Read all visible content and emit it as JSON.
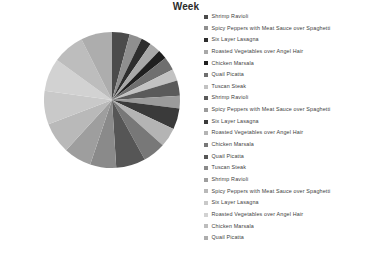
{
  "chart": {
    "title": "Week"
  },
  "chart_data": {
    "type": "pie",
    "title": "Week",
    "xlabel": "",
    "ylabel": "",
    "legend_position": "right",
    "grid": false,
    "center": [
      112,
      100
    ],
    "radius": 68,
    "start_angle_deg": -90,
    "direction": "clockwise",
    "categories": [
      "Shrimp Ravioli",
      "Spicy Peppers with Meat Sauce over Spaghetti",
      "Six Layer Lasagna",
      "Roasted Vegetables over Angel Hair",
      "Chicken Marsala",
      "Quail Picatta",
      "Tuscan Steak",
      "Shrimp Ravioli",
      "Spicy Peppers with Meat Sauce over Spaghetti",
      "Six Layer Lasagna",
      "Roasted Vegetables over Angel Hair",
      "Chicken Marsala",
      "Quail Picatta",
      "Tuscan Steak",
      "Shrimp Ravioli",
      "Spicy Peppers with Meat Sauce over Spaghetti",
      "Six Layer Lasagna",
      "Roasted Vegetables over Angel Hair",
      "Chicken Marsala",
      "Quail Picatta"
    ],
    "values": [
      4.2,
      3.0,
      2.4,
      2.6,
      2.2,
      3.2,
      2.8,
      3.6,
      3.0,
      5.0,
      4.6,
      5.4,
      7.0,
      6.2,
      6.6,
      7.4,
      8.0,
      7.8,
      7.6,
      7.4
    ],
    "colors": [
      "#4b4b4b",
      "#8f8f8f",
      "#2d2d2d",
      "#a8a8a8",
      "#1f1f1f",
      "#6f6f6f",
      "#c2c2c2",
      "#5a5a5a",
      "#9b9b9b",
      "#3a3a3a",
      "#b4b4b4",
      "#787878",
      "#565656",
      "#8a8a8a",
      "#9e9e9e",
      "#b9b9b9",
      "#c9c9c9",
      "#d2d2d2",
      "#bdbdbd",
      "#adadad"
    ]
  },
  "legend": {
    "items": [
      {
        "label": "Shrimp Ravioli",
        "color": "#4b4b4b"
      },
      {
        "label": "Spicy Peppers with Meat Sauce over Spaghetti",
        "color": "#8f8f8f"
      },
      {
        "label": "Six Layer Lasagna",
        "color": "#2d2d2d"
      },
      {
        "label": "Roasted Vegetables over Angel Hair",
        "color": "#a8a8a8"
      },
      {
        "label": "Chicken Marsala",
        "color": "#1f1f1f"
      },
      {
        "label": "Quail Picatta",
        "color": "#6f6f6f"
      },
      {
        "label": "Tuscan Steak",
        "color": "#c2c2c2"
      },
      {
        "label": "Shrimp Ravioli",
        "color": "#5a5a5a"
      },
      {
        "label": "Spicy Peppers with Meat Sauce over Spaghetti",
        "color": "#9b9b9b"
      },
      {
        "label": "Six Layer Lasagna",
        "color": "#3a3a3a"
      },
      {
        "label": "Roasted Vegetables over Angel Hair",
        "color": "#b4b4b4"
      },
      {
        "label": "Chicken Marsala",
        "color": "#787878"
      },
      {
        "label": "Quail Picatta",
        "color": "#565656"
      },
      {
        "label": "Tuscan Steak",
        "color": "#8a8a8a"
      },
      {
        "label": "Shrimp Ravioli",
        "color": "#9e9e9e"
      },
      {
        "label": "Spicy Peppers with Meat Sauce over Spaghetti",
        "color": "#b9b9b9"
      },
      {
        "label": "Six Layer Lasagna",
        "color": "#c9c9c9"
      },
      {
        "label": "Roasted Vegetables over Angel Hair",
        "color": "#d2d2d2"
      },
      {
        "label": "Chicken Marsala",
        "color": "#bdbdbd"
      },
      {
        "label": "Quail Picatta",
        "color": "#adadad"
      }
    ]
  }
}
